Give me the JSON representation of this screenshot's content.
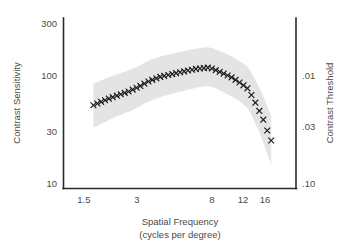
{
  "chart_data": {
    "type": "scatter",
    "title": "",
    "xlabel": "Spatial Frequency",
    "xlabel_sub": "(cycles per degree)",
    "ylabel": "Contrast Sensitivity",
    "ylabel_right": "Contrast Threshold",
    "xscale": "log",
    "yscale": "log",
    "xlim": [
      1.15,
      24.0
    ],
    "ylim": [
      9.0,
      340.0
    ],
    "grid": false,
    "legend": null,
    "xticks": [
      1.5,
      3,
      8,
      12,
      16
    ],
    "xticklabels": [
      "1.5",
      "3",
      "8",
      "12",
      "16"
    ],
    "yticks": [
      10,
      30,
      100,
      300
    ],
    "yticklabels": [
      "10",
      "30",
      "100",
      "300"
    ],
    "y2ticks": [
      0.01,
      0.03,
      0.1
    ],
    "y2ticklabels": [
      ".01",
      ".03",
      ".10"
    ],
    "marker": "x",
    "marker_color": "#1a1a1a",
    "band_color": "#e3e3e3",
    "band_label": "confidence band",
    "x": [
      1.7,
      1.79,
      1.88,
      1.98,
      2.08,
      2.19,
      2.31,
      2.43,
      2.56,
      2.69,
      2.84,
      2.99,
      3.14,
      3.31,
      3.49,
      3.67,
      3.87,
      4.07,
      4.29,
      4.52,
      4.76,
      5.01,
      5.28,
      5.56,
      5.85,
      6.17,
      6.49,
      6.84,
      7.2,
      7.58,
      7.99,
      8.41,
      8.86,
      9.33,
      9.82,
      10.34,
      10.89,
      11.47,
      12.08,
      12.72,
      13.4,
      14.11,
      14.86,
      15.65,
      16.48,
      17.36
    ],
    "y": [
      53,
      55,
      57,
      59,
      61,
      63,
      65,
      67,
      69,
      71,
      74,
      77,
      80,
      84,
      88,
      91,
      94,
      97,
      99,
      101,
      103,
      105,
      107,
      109,
      111,
      113,
      115,
      116,
      117,
      118,
      116,
      112,
      108,
      104,
      100,
      96,
      91,
      86,
      81,
      76,
      66,
      56,
      47,
      39,
      31,
      25
    ],
    "y_upper": [
      84,
      87,
      90,
      93,
      96,
      99,
      102,
      105,
      108,
      112,
      116,
      120,
      125,
      131,
      137,
      142,
      146,
      150,
      153,
      156,
      159,
      162,
      165,
      168,
      171,
      174,
      177,
      179,
      181,
      182,
      179,
      174,
      168,
      162,
      156,
      150,
      143,
      136,
      129,
      121,
      106,
      91,
      77,
      64,
      52,
      42
    ],
    "y_lower": [
      33,
      34,
      36,
      37,
      39,
      40,
      42,
      43,
      45,
      46,
      48,
      50,
      52,
      55,
      57,
      59,
      61,
      63,
      65,
      66,
      68,
      69,
      71,
      72,
      74,
      75,
      77,
      78,
      79,
      80,
      78,
      76,
      73,
      70,
      67,
      64,
      61,
      58,
      54,
      50,
      43,
      36,
      30,
      24,
      19,
      15
    ]
  },
  "axes": {
    "left_title": "Contrast Sensitivity",
    "right_title": "Contrast Threshold",
    "bottom_title": "Spatial Frequency",
    "bottom_subtitle": "(cycles per degree)",
    "left_ticks": [
      "300",
      "100",
      "30",
      "10"
    ],
    "right_ticks": [
      ".01",
      ".03",
      ".10"
    ],
    "bottom_ticks": [
      "1.5",
      "3",
      "8",
      "12",
      "16"
    ]
  },
  "colors": {
    "axis": "#2b2b2b",
    "text": "#4a4a4a",
    "marker": "#1a1a1a",
    "band": "#e3e3e3",
    "background": "#ffffff"
  }
}
